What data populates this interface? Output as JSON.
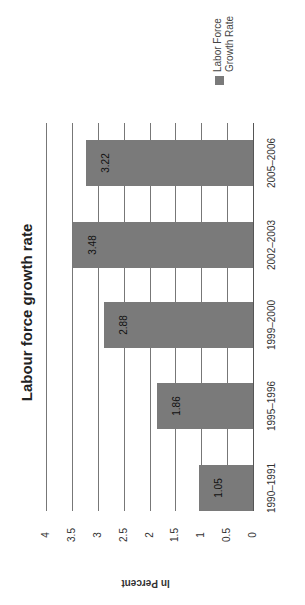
{
  "chart_data": {
    "type": "bar",
    "title": "Labour force growth rate",
    "xlabel": "",
    "ylabel": "In Percent",
    "categories": [
      "1990–1991",
      "1995–1996",
      "1999–2000",
      "2002–2003",
      "2005–2006"
    ],
    "series": [
      {
        "name": "Labor Force Growth Rate",
        "values": [
          1.05,
          1.86,
          2.88,
          3.48,
          3.22
        ],
        "color": "#7a7a7a"
      }
    ],
    "data_labels": [
      "1.05",
      "1.86",
      "2.88",
      "3.48",
      "3.22"
    ],
    "ylim": [
      0,
      4
    ],
    "yticks": [
      "0",
      "0.5",
      "1",
      "1.5",
      "2",
      "2.5",
      "3",
      "3.5",
      "4"
    ],
    "grid": true,
    "legend_position": "right",
    "orientation": "rotated 90° counter-clockwise on page"
  },
  "legend": {
    "line1": "Labor Force",
    "line2": "Growth Rate"
  }
}
